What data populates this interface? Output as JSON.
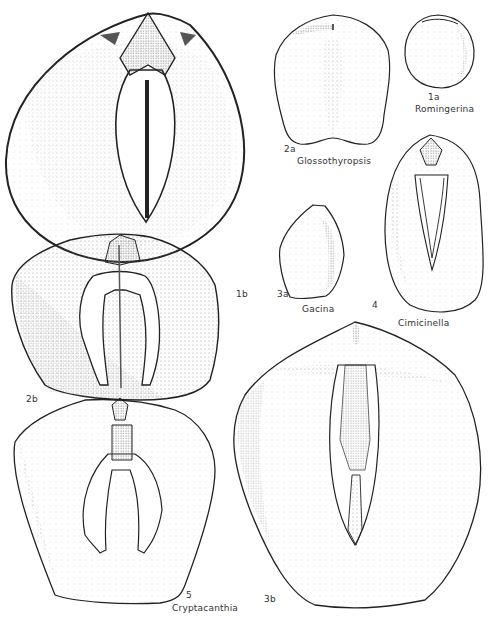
{
  "plate": {
    "figures": [
      {
        "id": "1a",
        "number": "1a",
        "genus": "Romingerina"
      },
      {
        "id": "1b",
        "number": "1b",
        "genus": "Romingerina"
      },
      {
        "id": "2a",
        "number": "2a",
        "genus": "Glossothyropsis"
      },
      {
        "id": "2b",
        "number": "2b",
        "genus": "Glossothyropsis"
      },
      {
        "id": "3a",
        "number": "3a",
        "genus": "Gacina"
      },
      {
        "id": "3b",
        "number": "3b",
        "genus": "Gacina"
      },
      {
        "id": "4",
        "number": "4",
        "genus": "Cimicinella"
      },
      {
        "id": "5",
        "number": "5",
        "genus": "Cryptacanthia"
      }
    ],
    "labels": {
      "n1a": "1a",
      "romingerina": "Romingerina",
      "n2a": "2a",
      "glossothyropsis": "Glossothyropsis",
      "n1b": "1b",
      "n3a": "3a",
      "gacina": "Gacina",
      "n4": "4",
      "cimicinella": "Cimicinella",
      "n2b": "2b",
      "n5": "5",
      "cryptacanthia": "Cryptacanthia",
      "n3b": "3b"
    },
    "colors": {
      "ink": "#2a2a2a",
      "stipple": "#9a9a9a",
      "paper": "#ffffff"
    }
  }
}
